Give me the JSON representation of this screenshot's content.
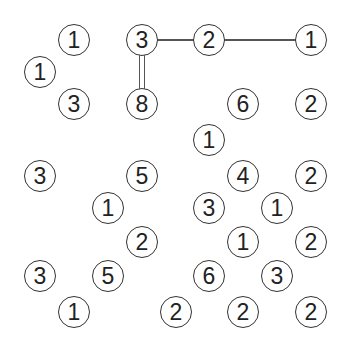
{
  "puzzle": {
    "type": "hashiwokakero",
    "grid": {
      "cols": 9,
      "rows": 9
    },
    "col_x": [
      40,
      74,
      108,
      142,
      176,
      209,
      243,
      277,
      311
    ],
    "row_y": [
      40,
      72,
      104,
      140,
      176,
      208,
      242,
      276,
      312
    ],
    "colors": {
      "line": "#555555",
      "circle_border": "#333333",
      "digit": "#222222",
      "background": "#ffffff"
    },
    "islands": [
      {
        "row": 0,
        "col": 1,
        "value": "1"
      },
      {
        "row": 0,
        "col": 3,
        "value": "3"
      },
      {
        "row": 0,
        "col": 5,
        "value": "2"
      },
      {
        "row": 0,
        "col": 8,
        "value": "1"
      },
      {
        "row": 1,
        "col": 0,
        "value": "1"
      },
      {
        "row": 2,
        "col": 1,
        "value": "3"
      },
      {
        "row": 2,
        "col": 3,
        "value": "8"
      },
      {
        "row": 2,
        "col": 6,
        "value": "6"
      },
      {
        "row": 2,
        "col": 8,
        "value": "2"
      },
      {
        "row": 3,
        "col": 5,
        "value": "1"
      },
      {
        "row": 4,
        "col": 0,
        "value": "3"
      },
      {
        "row": 4,
        "col": 3,
        "value": "5"
      },
      {
        "row": 4,
        "col": 6,
        "value": "4"
      },
      {
        "row": 4,
        "col": 8,
        "value": "2"
      },
      {
        "row": 5,
        "col": 2,
        "value": "1"
      },
      {
        "row": 5,
        "col": 5,
        "value": "3"
      },
      {
        "row": 5,
        "col": 7,
        "value": "1"
      },
      {
        "row": 6,
        "col": 3,
        "value": "2"
      },
      {
        "row": 6,
        "col": 6,
        "value": "1"
      },
      {
        "row": 6,
        "col": 8,
        "value": "2"
      },
      {
        "row": 7,
        "col": 0,
        "value": "3"
      },
      {
        "row": 7,
        "col": 2,
        "value": "5"
      },
      {
        "row": 7,
        "col": 5,
        "value": "6"
      },
      {
        "row": 7,
        "col": 7,
        "value": "3"
      },
      {
        "row": 8,
        "col": 1,
        "value": "1"
      },
      {
        "row": 8,
        "col": 4,
        "value": "2"
      },
      {
        "row": 8,
        "col": 6,
        "value": "2"
      },
      {
        "row": 8,
        "col": 8,
        "value": "2"
      }
    ],
    "bridges": [
      {
        "from": [
          0,
          3
        ],
        "to": [
          0,
          5
        ],
        "count": 1,
        "orientation": "horizontal"
      },
      {
        "from": [
          0,
          5
        ],
        "to": [
          0,
          8
        ],
        "count": 1,
        "orientation": "horizontal"
      },
      {
        "from": [
          0,
          3
        ],
        "to": [
          2,
          3
        ],
        "count": 2,
        "orientation": "vertical"
      }
    ]
  }
}
